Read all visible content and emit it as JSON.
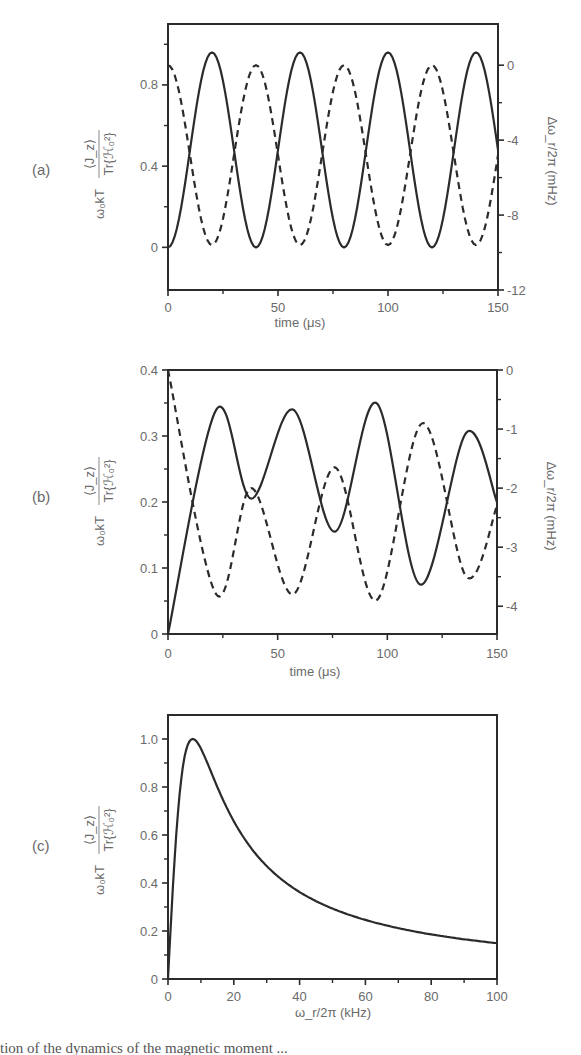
{
  "chart_data": [
    {
      "panel": "(a)",
      "type": "line",
      "xlabel": "time (μs)",
      "ylabel": "ω₀kT ⟨J_z⟩ / Tr{ℋ₀²}",
      "y2label": "Δω_r/2π (mHz)",
      "xlim": [
        0,
        150
      ],
      "ylim": [
        -0.21,
        1.1
      ],
      "y2lim": [
        -12,
        2.2
      ],
      "xticks": [
        0,
        50,
        100,
        150
      ],
      "xminor": [
        25,
        75,
        125
      ],
      "yticks": [
        0,
        0.4,
        0.8
      ],
      "yminor": [
        0.2,
        0.6,
        1.0
      ],
      "y2ticks": [
        0,
        -4,
        -8,
        -12
      ],
      "y2minor": [
        -2,
        -6,
        -10
      ],
      "series": [
        {
          "name": "magnetization (solid, left axis)",
          "style": "solid",
          "axis": "left",
          "x": [
            0,
            10,
            20,
            30,
            40,
            50,
            60,
            70,
            80,
            90,
            100,
            110,
            120,
            130,
            140,
            150
          ],
          "y": [
            0,
            0.48,
            0.96,
            0.48,
            0,
            0.48,
            0.96,
            0.48,
            0,
            0.48,
            0.96,
            0.48,
            0,
            0.48,
            0.96,
            0.48
          ]
        },
        {
          "name": "frequency shift (dashed, right axis)",
          "style": "dashed",
          "axis": "right",
          "x": [
            0,
            10,
            20,
            30,
            40,
            50,
            60,
            70,
            80,
            90,
            100,
            110,
            120,
            130,
            140,
            150
          ],
          "y": [
            0,
            -4.8,
            -9.6,
            -4.8,
            0,
            -4.8,
            -9.6,
            -4.8,
            0,
            -4.8,
            -9.6,
            -4.8,
            0,
            -4.8,
            -9.6,
            -4.8
          ]
        }
      ]
    },
    {
      "panel": "(b)",
      "type": "line",
      "xlabel": "time (μs)",
      "ylabel": "ω₀kT ⟨J_z⟩ / Tr{ℋ₀²}",
      "y2label": "Δω_r/2π (mHz)",
      "xlim": [
        0,
        150
      ],
      "ylim": [
        0,
        0.4
      ],
      "y2lim": [
        -4.47,
        0
      ],
      "xticks": [
        0,
        50,
        100,
        150
      ],
      "xminor": [
        25,
        75,
        125
      ],
      "yticks": [
        0,
        0.1,
        0.2,
        0.3,
        0.4
      ],
      "yminor": [
        0.05,
        0.15,
        0.25,
        0.35
      ],
      "y2ticks": [
        0,
        -1,
        -2,
        -3,
        -4
      ],
      "y2minor": [
        -0.5,
        -1.5,
        -2.5,
        -3.5
      ],
      "series": [
        {
          "name": "magnetization (solid, left axis)",
          "style": "solid",
          "axis": "left",
          "x": [
            0,
            22,
            38,
            57,
            76,
            95,
            115,
            136,
            150
          ],
          "y": [
            0,
            0.34,
            0.205,
            0.34,
            0.155,
            0.35,
            0.075,
            0.305,
            0.2
          ]
        },
        {
          "name": "frequency shift (dashed, right axis)",
          "style": "dashed",
          "axis": "right",
          "x": [
            0,
            22,
            38,
            57,
            76,
            95,
            116,
            136,
            150
          ],
          "y": [
            0,
            -3.8,
            -2.0,
            -3.8,
            -1.65,
            -3.9,
            -0.9,
            -3.5,
            -2.3
          ]
        }
      ]
    },
    {
      "panel": "(c)",
      "type": "line",
      "xlabel": "ω_r/2π (kHz)",
      "ylabel": "ω₀kT ⟨J_z⟩ / Tr{ℋ₀²}",
      "xlim": [
        0,
        100
      ],
      "ylim": [
        0,
        1.1
      ],
      "xticks": [
        0,
        20,
        40,
        60,
        80,
        100
      ],
      "xminor": [
        10,
        30,
        50,
        70,
        90
      ],
      "yticks": [
        0,
        0.2,
        0.4,
        0.6,
        0.8,
        1.0
      ],
      "yminor": [
        0.1,
        0.3,
        0.5,
        0.7,
        0.9
      ],
      "series": [
        {
          "name": "steady-state magnetization",
          "style": "solid",
          "x": [
            0,
            2,
            4,
            7.5,
            10,
            15,
            20,
            30,
            40,
            50,
            60,
            70,
            80,
            90,
            100
          ],
          "y": [
            0,
            0.5,
            0.83,
            1.0,
            0.96,
            0.8,
            0.66,
            0.47,
            0.36,
            0.29,
            0.245,
            0.21,
            0.185,
            0.165,
            0.149
          ]
        }
      ]
    }
  ],
  "labels": {
    "panel_a": "(a)",
    "panel_b": "(b)",
    "panel_c": "(c)",
    "time_axis": "time (μs)",
    "freq_axis": "ω_r/2π (kHz)",
    "right_axis": "Δω_r/2π (mHz)",
    "left_axis_prefix": "ω₀kT",
    "left_axis_num": "⟨J_z⟩",
    "left_axis_den": "Tr{ℋ₀²}"
  },
  "caption_fragment": "tion of the dynamics of the magnetic moment ..."
}
